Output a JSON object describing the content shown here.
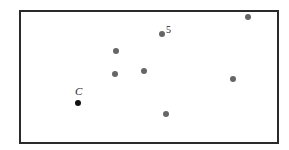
{
  "diagram": {
    "frame": {
      "left": 19,
      "top": 10,
      "right": 277,
      "bottom": 142,
      "stroke": "#2a2a2a"
    },
    "point_color": "#666666",
    "center_color": "#111111",
    "points": [
      {
        "id": "p5",
        "x": 162,
        "y": 34,
        "label": "5",
        "label_x": 166,
        "label_y": 25
      },
      {
        "id": "p-top-right",
        "x": 248,
        "y": 17
      },
      {
        "id": "p-upper-left",
        "x": 116,
        "y": 51
      },
      {
        "id": "p-mid-left",
        "x": 115,
        "y": 74
      },
      {
        "id": "p-mid",
        "x": 144,
        "y": 71
      },
      {
        "id": "p-right",
        "x": 233,
        "y": 79
      },
      {
        "id": "p-bottom",
        "x": 166,
        "y": 114
      }
    ],
    "center": {
      "x": 78,
      "y": 103,
      "label": "C",
      "label_x": 75,
      "label_y": 86
    }
  }
}
